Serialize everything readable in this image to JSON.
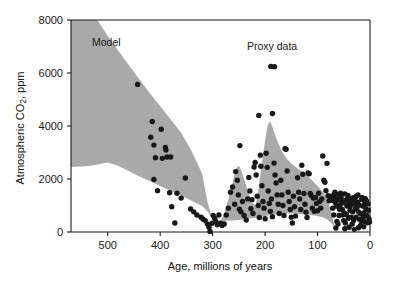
{
  "figure": {
    "background_color": "#ffffff",
    "axis_color": "#1a1a1a",
    "band_color": "#a9a9a9",
    "dot_color": "#181818"
  },
  "annotations": {
    "model_label": "Model",
    "proxy_label": "Proxy data"
  },
  "chart_data": {
    "type": "scatter",
    "title": "",
    "subtitle": "",
    "xlabel": "Age, millions of years",
    "ylabel": "Atmospheric CO₂, ppm",
    "ylabel_parts": {
      "pre": "Atmospheric CO",
      "sub": "2",
      "post": ", ppm"
    },
    "xlim": [
      570,
      0
    ],
    "ylim": [
      0,
      8000
    ],
    "x_axis_reversed": true,
    "grid": false,
    "legend_position": "inline-annotations",
    "xticks": [
      500,
      400,
      300,
      200,
      100,
      0
    ],
    "xtick_labels": [
      "500",
      "400",
      "300",
      "200",
      "100",
      "0"
    ],
    "yticks": [
      0,
      2000,
      4000,
      6000,
      8000
    ],
    "ytick_labels": [
      "0",
      "2000",
      "4000",
      "6000",
      "8000"
    ],
    "series": [
      {
        "name": "Model",
        "type": "band",
        "fill": "#a9a9a9",
        "upper": [
          [
            570,
            8000
          ],
          [
            520,
            8000
          ],
          [
            500,
            7400
          ],
          [
            460,
            6300
          ],
          [
            420,
            5250
          ],
          [
            390,
            4500
          ],
          [
            360,
            3750
          ],
          [
            340,
            3050
          ],
          [
            320,
            2200
          ],
          [
            310,
            1150
          ],
          [
            300,
            430
          ],
          [
            295,
            330
          ],
          [
            290,
            300
          ],
          [
            285,
            420
          ],
          [
            278,
            700
          ],
          [
            270,
            1250
          ],
          [
            262,
            1850
          ],
          [
            256,
            2380
          ],
          [
            250,
            2500
          ],
          [
            246,
            2350
          ],
          [
            240,
            2000
          ],
          [
            232,
            1500
          ],
          [
            225,
            1100
          ],
          [
            218,
            1000
          ],
          [
            212,
            1700
          ],
          [
            206,
            2600
          ],
          [
            200,
            3450
          ],
          [
            195,
            4050
          ],
          [
            190,
            4180
          ],
          [
            185,
            3900
          ],
          [
            178,
            3500
          ],
          [
            168,
            3050
          ],
          [
            158,
            2750
          ],
          [
            148,
            2550
          ],
          [
            138,
            2400
          ],
          [
            128,
            2250
          ],
          [
            118,
            2100
          ],
          [
            108,
            1900
          ],
          [
            98,
            1700
          ],
          [
            88,
            1450
          ],
          [
            80,
            1150
          ],
          [
            74,
            780
          ],
          [
            70,
            400
          ],
          [
            66,
            150
          ],
          [
            62,
            40
          ]
        ],
        "lower": [
          [
            570,
            2450
          ],
          [
            540,
            2480
          ],
          [
            520,
            2550
          ],
          [
            500,
            2620
          ],
          [
            480,
            2500
          ],
          [
            460,
            2300
          ],
          [
            440,
            2100
          ],
          [
            420,
            1920
          ],
          [
            400,
            1740
          ],
          [
            380,
            1560
          ],
          [
            360,
            1380
          ],
          [
            340,
            1180
          ],
          [
            320,
            980
          ],
          [
            310,
            780
          ],
          [
            302,
            560
          ],
          [
            296,
            330
          ],
          [
            290,
            290
          ],
          [
            284,
            330
          ],
          [
            276,
            420
          ],
          [
            268,
            430
          ],
          [
            258,
            440
          ],
          [
            250,
            450
          ],
          [
            242,
            470
          ],
          [
            234,
            500
          ],
          [
            226,
            520
          ],
          [
            218,
            540
          ],
          [
            210,
            570
          ],
          [
            200,
            600
          ],
          [
            190,
            640
          ],
          [
            180,
            660
          ],
          [
            170,
            680
          ],
          [
            160,
            700
          ],
          [
            150,
            700
          ],
          [
            140,
            690
          ],
          [
            130,
            670
          ],
          [
            120,
            650
          ],
          [
            110,
            630
          ],
          [
            100,
            600
          ],
          [
            90,
            560
          ],
          [
            82,
            480
          ],
          [
            76,
            380
          ],
          [
            70,
            250
          ],
          [
            66,
            120
          ],
          [
            62,
            40
          ]
        ]
      },
      {
        "name": "Proxy data",
        "type": "scatter",
        "marker": "circle",
        "color": "#181818",
        "points": [
          [
            443,
            5570
          ],
          [
            415,
            4170
          ],
          [
            418,
            3580
          ],
          [
            412,
            3280
          ],
          [
            409,
            2800
          ],
          [
            412,
            1980
          ],
          [
            405,
            1560
          ],
          [
            398,
            3880
          ],
          [
            396,
            2780
          ],
          [
            390,
            3190
          ],
          [
            389,
            3090
          ],
          [
            387,
            2830
          ],
          [
            380,
            2830
          ],
          [
            382,
            1480
          ],
          [
            378,
            950
          ],
          [
            372,
            340
          ],
          [
            368,
            1460
          ],
          [
            360,
            1280
          ],
          [
            352,
            2040
          ],
          [
            342,
            870
          ],
          [
            336,
            760
          ],
          [
            330,
            640
          ],
          [
            322,
            560
          ],
          [
            318,
            480
          ],
          [
            314,
            430
          ],
          [
            310,
            300
          ],
          [
            307,
            180
          ],
          [
            305,
            20
          ],
          [
            301,
            330
          ],
          [
            299,
            620
          ],
          [
            296,
            520
          ],
          [
            294,
            400
          ],
          [
            291,
            270
          ],
          [
            288,
            640
          ],
          [
            285,
            330
          ],
          [
            282,
            250
          ],
          [
            278,
            300
          ],
          [
            274,
            640
          ],
          [
            270,
            900
          ],
          [
            266,
            1500
          ],
          [
            262,
            1700
          ],
          [
            258,
            1050
          ],
          [
            256,
            2280
          ],
          [
            253,
            1950
          ],
          [
            251,
            1400
          ],
          [
            249,
            860
          ],
          [
            246,
            760
          ],
          [
            243,
            1150
          ],
          [
            248,
            3260
          ],
          [
            240,
            620
          ],
          [
            236,
            450
          ],
          [
            233,
            1250
          ],
          [
            231,
            2060
          ],
          [
            229,
            1550
          ],
          [
            227,
            880
          ],
          [
            225,
            1220
          ],
          [
            223,
            700
          ],
          [
            221,
            2450
          ],
          [
            219,
            2620
          ],
          [
            217,
            2150
          ],
          [
            215,
            1350
          ],
          [
            213,
            1000
          ],
          [
            211,
            550
          ],
          [
            209,
            2900
          ],
          [
            208,
            2480
          ],
          [
            206,
            1750
          ],
          [
            204,
            1150
          ],
          [
            202,
            900
          ],
          [
            200,
            500
          ],
          [
            212,
            4400
          ],
          [
            198,
            2970
          ],
          [
            196,
            2440
          ],
          [
            194,
            1550
          ],
          [
            192,
            1080
          ],
          [
            190,
            780
          ],
          [
            188,
            1250
          ],
          [
            186,
            580
          ],
          [
            189,
            6250
          ],
          [
            182,
            6240
          ],
          [
            183,
            2600
          ],
          [
            181,
            2150
          ],
          [
            179,
            1850
          ],
          [
            177,
            1400
          ],
          [
            175,
            1050
          ],
          [
            173,
            700
          ],
          [
            186,
            4470
          ],
          [
            170,
            1950
          ],
          [
            168,
            1400
          ],
          [
            166,
            1000
          ],
          [
            164,
            620
          ],
          [
            162,
            3140
          ],
          [
            160,
            3120
          ],
          [
            158,
            2300
          ],
          [
            156,
            1500
          ],
          [
            154,
            1150
          ],
          [
            152,
            850
          ],
          [
            150,
            560
          ],
          [
            148,
            340
          ],
          [
            146,
            1350
          ],
          [
            144,
            950
          ],
          [
            142,
            600
          ],
          [
            138,
            2050
          ],
          [
            136,
            1500
          ],
          [
            134,
            1250
          ],
          [
            132,
            850
          ],
          [
            130,
            2520
          ],
          [
            128,
            2180
          ],
          [
            126,
            1450
          ],
          [
            124,
            1050
          ],
          [
            122,
            750
          ],
          [
            120,
            550
          ],
          [
            118,
            2230
          ],
          [
            116,
            2200
          ],
          [
            114,
            1450
          ],
          [
            112,
            1380
          ],
          [
            110,
            900
          ],
          [
            108,
            1280
          ],
          [
            106,
            780
          ],
          [
            104,
            1300
          ],
          [
            102,
            1080
          ],
          [
            100,
            800
          ],
          [
            98,
            1460
          ],
          [
            96,
            1150
          ],
          [
            94,
            900
          ],
          [
            92,
            1250
          ],
          [
            90,
            2870
          ],
          [
            88,
            1950
          ],
          [
            86,
            1880
          ],
          [
            84,
            1560
          ],
          [
            82,
            2590
          ],
          [
            80,
            1370
          ],
          [
            78,
            1180
          ],
          [
            76,
            1340
          ],
          [
            74,
            1290
          ],
          [
            72,
            1200
          ],
          [
            70,
            1380
          ],
          [
            68,
            1420
          ],
          [
            66,
            1100
          ],
          [
            64,
            980
          ],
          [
            62,
            1420
          ],
          [
            60,
            1220
          ],
          [
            58,
            860
          ],
          [
            56,
            1460
          ],
          [
            54,
            1150
          ],
          [
            52,
            640
          ],
          [
            50,
            430
          ],
          [
            48,
            1440
          ],
          [
            46,
            1200
          ],
          [
            44,
            980
          ],
          [
            42,
            1380
          ],
          [
            40,
            1080
          ],
          [
            38,
            820
          ],
          [
            36,
            560
          ],
          [
            34,
            300
          ],
          [
            32,
            1290
          ],
          [
            30,
            1070
          ],
          [
            28,
            880
          ],
          [
            26,
            1350
          ],
          [
            24,
            1120
          ],
          [
            22,
            760
          ],
          [
            20,
            480
          ],
          [
            18,
            250
          ],
          [
            16,
            1230
          ],
          [
            14,
            980
          ],
          [
            12,
            720
          ],
          [
            10,
            1080
          ],
          [
            8,
            880
          ],
          [
            6,
            620
          ],
          [
            4,
            1060
          ],
          [
            3,
            820
          ],
          [
            2,
            500
          ],
          [
            1,
            380
          ],
          [
            71,
            900
          ],
          [
            69,
            640
          ],
          [
            67,
            1500
          ],
          [
            65,
            1250
          ],
          [
            63,
            400
          ],
          [
            61,
            300
          ],
          [
            59,
            620
          ],
          [
            57,
            1020
          ],
          [
            55,
            1300
          ],
          [
            53,
            850
          ],
          [
            51,
            1100
          ],
          [
            49,
            720
          ],
          [
            47,
            340
          ],
          [
            45,
            660
          ],
          [
            43,
            1250
          ],
          [
            41,
            520
          ],
          [
            39,
            1260
          ],
          [
            37,
            1000
          ],
          [
            35,
            1180
          ],
          [
            33,
            760
          ],
          [
            31,
            440
          ],
          [
            29,
            1220
          ],
          [
            27,
            560
          ],
          [
            25,
            920
          ],
          [
            23,
            1400
          ],
          [
            21,
            1020
          ],
          [
            19,
            700
          ],
          [
            17,
            430
          ],
          [
            15,
            1300
          ],
          [
            13,
            560
          ],
          [
            11,
            400
          ],
          [
            9,
            1260
          ],
          [
            7,
            1180
          ],
          [
            5,
            350
          ],
          [
            65,
            150
          ],
          [
            48,
            120
          ],
          [
            40,
            180
          ],
          [
            30,
            100
          ],
          [
            22,
            160
          ],
          [
            12,
            200
          ]
        ]
      }
    ]
  }
}
